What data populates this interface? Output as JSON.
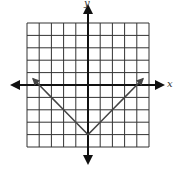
{
  "chart_data": {
    "type": "line",
    "title": "",
    "xlabel": "x",
    "ylabel": "y",
    "xlim": [
      -5,
      5
    ],
    "ylim": [
      -5,
      5
    ],
    "grid": true,
    "grid_step": 1,
    "tick_labels": false,
    "series": [
      {
        "name": "y = |x| - 4",
        "x": [
          -4.5,
          -4,
          -3,
          -2,
          -1,
          0,
          1,
          2,
          3,
          4,
          4.5
        ],
        "y": [
          0.5,
          0,
          -1,
          -2,
          -3,
          -4,
          -3,
          -2,
          -1,
          0,
          0.5
        ],
        "arrows_at_ends": true,
        "color": "#444444"
      }
    ],
    "annotations": []
  },
  "axes": {
    "x_label": "x",
    "y_label": "y"
  },
  "colors": {
    "grid": "#333333",
    "axis": "#111111",
    "curve": "#444444"
  }
}
